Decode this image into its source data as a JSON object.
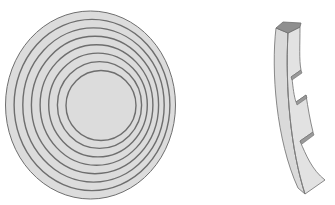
{
  "figure": {
    "left": {
      "label": "concentric-rings-disc",
      "fill": "#dcdcdc",
      "stroke": "#6e6e6e",
      "rings": [
        {
          "cx": 90.5,
          "cy": 105,
          "rx": 85,
          "ry": 94
        },
        {
          "cx": 92.0,
          "cy": 105,
          "rx": 77.9,
          "ry": 85.6
        },
        {
          "cx": 93.5,
          "cy": 105,
          "rx": 70.7,
          "ry": 77.1
        },
        {
          "cx": 95.0,
          "cy": 105,
          "rx": 63.6,
          "ry": 68.7
        },
        {
          "cx": 96.5,
          "cy": 105,
          "rx": 56.4,
          "ry": 60.3
        },
        {
          "cx": 98.0,
          "cy": 105,
          "rx": 49.3,
          "ry": 51.9
        },
        {
          "cx": 99.5,
          "cy": 105,
          "rx": 42.1,
          "ry": 43.4
        },
        {
          "cx": 101.0,
          "cy": 105.5,
          "rx": 35,
          "ry": 35
        }
      ]
    },
    "right": {
      "label": "curved-stepped-segment",
      "face_fill": "#dedede",
      "side_fill": "#cfcfcf",
      "top_fill": "#8c8c8c",
      "stroke": "#6e6e6e",
      "step_count": 3
    }
  }
}
